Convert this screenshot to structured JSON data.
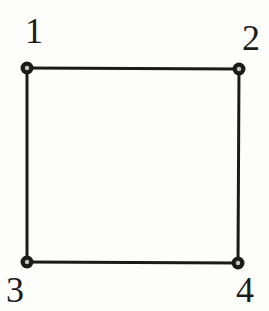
{
  "diagram": {
    "type": "graph",
    "background_color": "#fdfdfb",
    "ink_color": "#1b1b1b",
    "node_hole_color": "#c9c3b9",
    "edge_width": 3,
    "node_radius": 6.5,
    "node_hole_radius": 2.2,
    "label_font_size": 36,
    "nodes": [
      {
        "id": "1",
        "label": "1",
        "x": 27,
        "y": 68,
        "label_x": 34,
        "label_y": 43
      },
      {
        "id": "2",
        "label": "2",
        "x": 239,
        "y": 69,
        "label_x": 251,
        "label_y": 50
      },
      {
        "id": "3",
        "label": "3",
        "x": 27,
        "y": 262,
        "label_x": 15,
        "label_y": 302
      },
      {
        "id": "4",
        "label": "4",
        "x": 238,
        "y": 263,
        "label_x": 245,
        "label_y": 302
      }
    ],
    "edges": [
      {
        "from": "1",
        "to": "2"
      },
      {
        "from": "2",
        "to": "4"
      },
      {
        "from": "3",
        "to": "4"
      },
      {
        "from": "1",
        "to": "3"
      }
    ]
  }
}
